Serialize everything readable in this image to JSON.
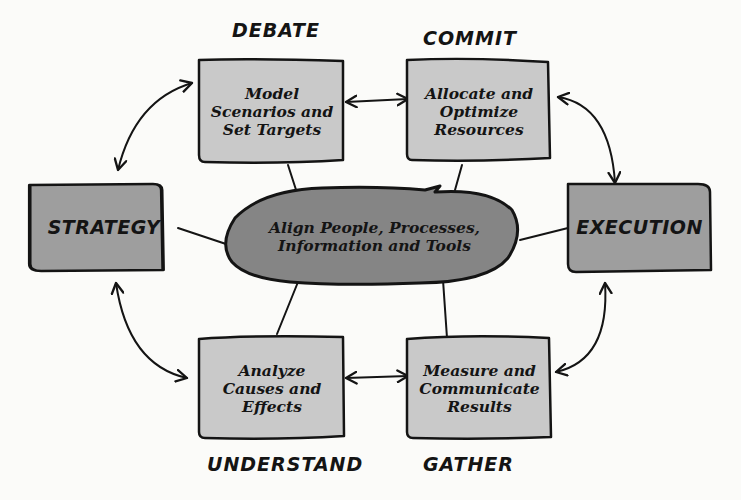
{
  "colors": {
    "background": "#fbfbf9",
    "step_box_fill": "#c9c9c9",
    "main_box_fill": "#9e9e9e",
    "hub_fill": "#858585",
    "stroke": "#141414"
  },
  "phases": {
    "debate": "DEBATE",
    "commit": "COMMIT",
    "understand": "UNDERSTAND",
    "gather": "GATHER"
  },
  "boxes": {
    "model": {
      "lines": [
        "Model",
        "Scenarios and",
        "Set Targets"
      ]
    },
    "allocate": {
      "lines": [
        "Allocate and",
        "Optimize",
        "Resources"
      ]
    },
    "analyze": {
      "lines": [
        "Analyze",
        "Causes and",
        "Effects"
      ]
    },
    "measure": {
      "lines": [
        "Measure and",
        "Communicate",
        "Results"
      ]
    }
  },
  "strategy": {
    "label": "STRATEGY"
  },
  "execution": {
    "label": "EXECUTION"
  },
  "hub": {
    "lines": [
      "Align People, Processes,",
      "Information and Tools"
    ]
  }
}
